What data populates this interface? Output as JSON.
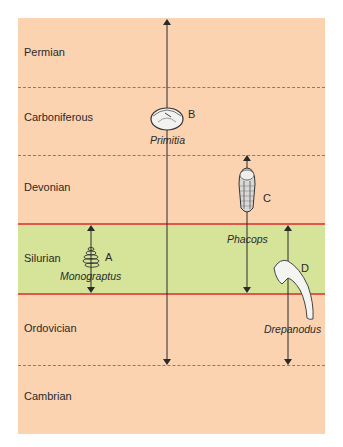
{
  "diagram": {
    "colors": {
      "background": "#fbd3b0",
      "highlight_band": "#d6e49a",
      "boundary_line": "#e0574a",
      "arrow": "#2a2a2a"
    },
    "periods": [
      {
        "name": "Permian",
        "boundary_below": "dashed"
      },
      {
        "name": "Carboniferous",
        "boundary_below": "dashed"
      },
      {
        "name": "Devonian",
        "boundary_below": "solid"
      },
      {
        "name": "Silurian",
        "boundary_below": "solid",
        "highlighted": true
      },
      {
        "name": "Ordovician",
        "boundary_below": "dashed"
      },
      {
        "name": "Cambrian"
      }
    ],
    "fossils": [
      {
        "letter": "A",
        "name": "Monograptus",
        "range": "Silurian",
        "icon": "graptolite-icon"
      },
      {
        "letter": "B",
        "name": "Primitia",
        "range": "Ordovician to Permian (arrow extends upward)",
        "icon": "ostracod-icon"
      },
      {
        "letter": "C",
        "name": "Phacops",
        "range": "Silurian to Devonian",
        "icon": "trilobite-icon"
      },
      {
        "letter": "D",
        "name": "Drepanodus",
        "range": "Ordovician to Silurian",
        "icon": "conodont-icon"
      }
    ]
  }
}
